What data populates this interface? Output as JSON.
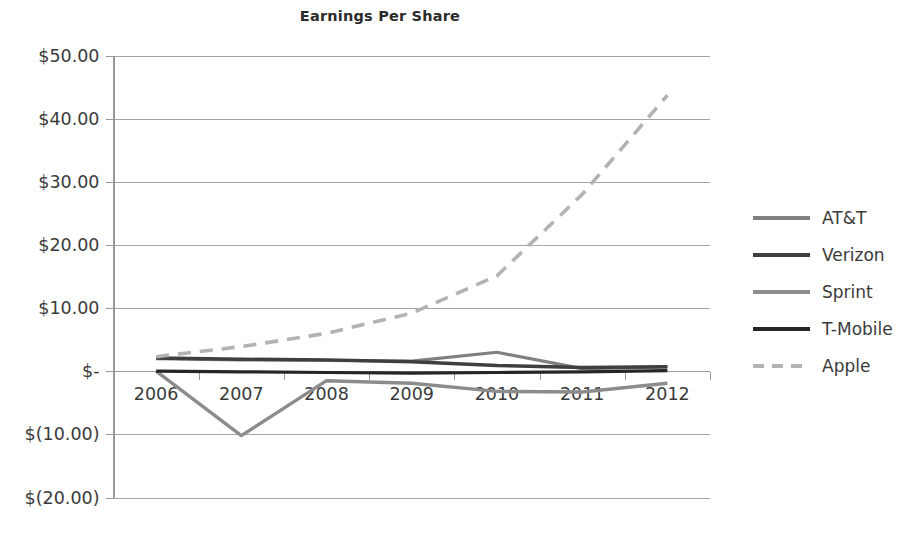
{
  "chart_data": {
    "type": "line",
    "title": "Earnings Per Share",
    "xlabel": "",
    "ylabel": "",
    "grid": true,
    "legend_position": "right",
    "categories": [
      "2006",
      "2007",
      "2008",
      "2009",
      "2010",
      "2011",
      "2012"
    ],
    "x": [
      2006,
      2007,
      2008,
      2009,
      2010,
      2011,
      2012
    ],
    "ylim": [
      -20,
      50
    ],
    "ytick_values": [
      50,
      40,
      30,
      20,
      10,
      0,
      -10,
      -20
    ],
    "ytick_labels": [
      "$50.00",
      "$40.00",
      "$30.00",
      "$20.00",
      "$10.00",
      "$-",
      "$(10.00)",
      "$(20.00)"
    ],
    "series": [
      {
        "name": "AT&T",
        "color": "#808080",
        "style": "solid",
        "width": 3.2,
        "values": [
          2.0,
          1.8,
          1.7,
          1.6,
          3.0,
          0.4,
          0.7
        ]
      },
      {
        "name": "Verizon",
        "color": "#3f3f3f",
        "style": "solid",
        "width": 3.4,
        "values": [
          2.1,
          1.9,
          1.8,
          1.5,
          0.9,
          0.6,
          0.7
        ]
      },
      {
        "name": "Sprint",
        "color": "#8c8c8c",
        "style": "solid",
        "width": 3.4,
        "values": [
          0.0,
          -10.2,
          -1.5,
          -1.9,
          -3.2,
          -3.3,
          -1.9
        ]
      },
      {
        "name": "T-Mobile",
        "color": "#262626",
        "style": "solid",
        "width": 3.2,
        "values": [
          0.0,
          -0.1,
          -0.2,
          -0.3,
          -0.2,
          -0.1,
          0.1
        ]
      },
      {
        "name": "Apple",
        "color": "#b3b3b3",
        "style": "dashed",
        "width": 3.6,
        "values": [
          2.3,
          3.9,
          6.0,
          9.2,
          15.1,
          28.0,
          43.7
        ]
      }
    ]
  },
  "legend": {
    "items": [
      {
        "label": "AT&T"
      },
      {
        "label": "Verizon"
      },
      {
        "label": "Sprint"
      },
      {
        "label": "T-Mobile"
      },
      {
        "label": "Apple"
      }
    ]
  },
  "colors": {
    "gridline": "#a6a6a6",
    "axis": "#9a9a9a",
    "text": "#3a3a3a",
    "title": "#2b2b2b",
    "background": "#ffffff"
  }
}
